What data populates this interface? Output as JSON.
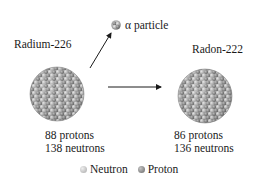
{
  "diagram": {
    "parent": {
      "name": "Radium-226",
      "protons_label": "88 protons",
      "neutrons_label": "138 neutrons",
      "protons": 88,
      "neutrons": 138
    },
    "emission": {
      "label": "α particle",
      "icon": "alpha-particle-icon"
    },
    "daughter": {
      "name": "Radon-222",
      "protons_label": "86 protons",
      "neutrons_label": "136 neutrons",
      "protons": 86,
      "neutrons": 136
    },
    "legend": {
      "neutron_label": "Neutron",
      "proton_label": "Proton",
      "neutron_color": "#bdbdbd",
      "proton_color": "#8a8a8a"
    },
    "colors": {
      "arrow": "#1a1a1a",
      "text": "#1a1a1a",
      "neutron": "#c4c4c4",
      "proton": "#8c8c8c"
    }
  }
}
